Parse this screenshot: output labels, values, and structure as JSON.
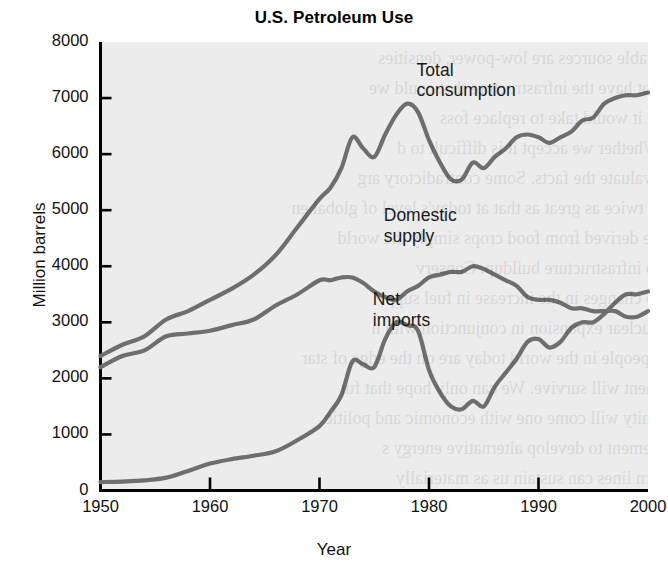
{
  "chart_data": {
    "type": "line",
    "title": "U.S. Petroleum Use",
    "xlabel": "Year",
    "ylabel": "Million barrels",
    "xlim": [
      1950,
      2000
    ],
    "ylim": [
      0,
      8000
    ],
    "xticks": [
      "1950",
      "1960",
      "1970",
      "1980",
      "1990",
      "2000"
    ],
    "yticks": [
      "0",
      "1000",
      "2000",
      "3000",
      "4000",
      "5000",
      "6000",
      "7000",
      "8000"
    ],
    "grid": false,
    "legend_position": "inline-annotations",
    "line_color": "#6e6e6e",
    "background_color": "#ececec",
    "series": [
      {
        "name": "Total consumption",
        "label_x": 1988,
        "label_y": 7400,
        "x": [
          1950,
          1952,
          1954,
          1956,
          1958,
          1960,
          1962,
          1964,
          1966,
          1968,
          1970,
          1971,
          1972,
          1973,
          1974,
          1975,
          1976,
          1977,
          1978,
          1979,
          1980,
          1981,
          1982,
          1983,
          1984,
          1985,
          1986,
          1987,
          1988,
          1989,
          1990,
          1991,
          1992,
          1993,
          1994,
          1995,
          1996,
          1997,
          1998,
          1999,
          2000
        ],
        "values": [
          2400,
          2600,
          2750,
          3050,
          3200,
          3400,
          3600,
          3850,
          4200,
          4700,
          5200,
          5400,
          5750,
          6300,
          6100,
          5950,
          6350,
          6700,
          6900,
          6750,
          6250,
          5850,
          5550,
          5550,
          5850,
          5750,
          5950,
          6100,
          6300,
          6350,
          6300,
          6200,
          6300,
          6400,
          6600,
          6650,
          6900,
          7000,
          7050,
          7050,
          7100
        ]
      },
      {
        "name": "Domestic supply",
        "label_x": 1985,
        "label_y": 4800,
        "x": [
          1950,
          1952,
          1954,
          1956,
          1958,
          1960,
          1962,
          1964,
          1966,
          1968,
          1970,
          1971,
          1972,
          1973,
          1974,
          1975,
          1976,
          1977,
          1978,
          1979,
          1980,
          1981,
          1982,
          1983,
          1984,
          1985,
          1986,
          1987,
          1988,
          1989,
          1990,
          1991,
          1992,
          1993,
          1994,
          1995,
          1996,
          1997,
          1998,
          1999,
          2000
        ],
        "values": [
          2200,
          2400,
          2500,
          2750,
          2800,
          2850,
          2950,
          3050,
          3300,
          3500,
          3750,
          3750,
          3800,
          3800,
          3700,
          3550,
          3450,
          3400,
          3550,
          3650,
          3800,
          3850,
          3900,
          3900,
          4000,
          3950,
          3850,
          3750,
          3650,
          3450,
          3400,
          3400,
          3350,
          3250,
          3250,
          3200,
          3200,
          3200,
          3100,
          3100,
          3200
        ]
      },
      {
        "name": "Net imports",
        "label_x": 1984,
        "label_y": 3300,
        "x": [
          1950,
          1952,
          1954,
          1956,
          1958,
          1960,
          1962,
          1964,
          1966,
          1968,
          1970,
          1971,
          1972,
          1973,
          1974,
          1975,
          1976,
          1977,
          1978,
          1979,
          1980,
          1981,
          1982,
          1983,
          1984,
          1985,
          1986,
          1987,
          1988,
          1989,
          1990,
          1991,
          1992,
          1993,
          1994,
          1995,
          1996,
          1997,
          1998,
          1999,
          2000
        ],
        "values": [
          150,
          160,
          180,
          230,
          350,
          480,
          560,
          620,
          700,
          900,
          1150,
          1400,
          1700,
          2300,
          2250,
          2200,
          2700,
          3000,
          2950,
          2850,
          2150,
          1750,
          1500,
          1450,
          1600,
          1500,
          1850,
          2100,
          2350,
          2650,
          2700,
          2550,
          2650,
          2900,
          3000,
          3000,
          3150,
          3350,
          3500,
          3500,
          3550
        ]
      }
    ]
  },
  "bleed_through": {
    "visible": true,
    "lines": [
      "wable sources are low-power, densities",
      "not have the infrastructure that could we",
      "at it would take to replace foss",
      "Whether we accept it is difficult to d",
      "evaluate the facts. Some contradictory arg",
      "is twice as great as that at today's level of global en",
      "be derived from food crops simply the world",
      "to infrastructure buildup. Conserv",
      "to changes in the increase in fuel supp",
      "nuclear expansion in conjunction with n",
      "r people in the world today are on the edge of star",
      "ment will survive. We can only hope that fut",
      "unity will come one with economic and politic",
      "vement to develop alternative energy s",
      "urn lines can sustain us as materially"
    ]
  }
}
